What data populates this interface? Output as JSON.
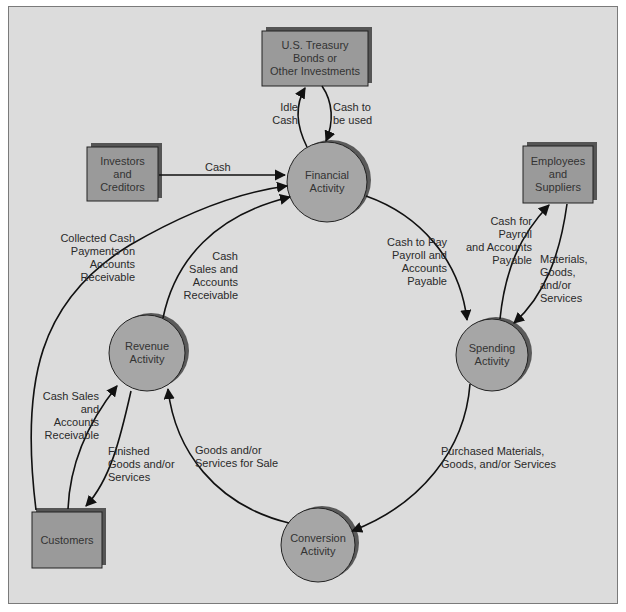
{
  "diagram": {
    "nodes": {
      "treasury": {
        "type": "box",
        "label": "U.S. Treasury\nBonds or\nOther Investments"
      },
      "investors": {
        "type": "box",
        "label": "Investors\nand\nCreditors"
      },
      "employees": {
        "type": "box",
        "label": "Employees\nand\nSuppliers"
      },
      "customers": {
        "type": "box",
        "label": "Customers"
      },
      "financial": {
        "type": "circle",
        "label": "Financial\nActivity"
      },
      "revenue": {
        "type": "circle",
        "label": "Revenue\nActivity"
      },
      "spending": {
        "type": "circle",
        "label": "Spending\nActivity"
      },
      "conversion": {
        "type": "circle",
        "label": "Conversion\nActivity"
      }
    },
    "edges": {
      "idle_cash": {
        "from": "financial",
        "to": "treasury",
        "label": "Idle\nCash"
      },
      "cash_to_be_used": {
        "from": "treasury",
        "to": "financial",
        "label": "Cash to\nbe used"
      },
      "investor_cash": {
        "from": "investors",
        "to": "financial",
        "label": "Cash"
      },
      "collected_cash": {
        "from": "customers",
        "to": "financial",
        "label": "Collected Cash\nPayments on\nAccounts\nReceivable"
      },
      "cash_sales_fin": {
        "from": "revenue",
        "to": "financial",
        "label": "Cash\nSales and\nAccounts\nReceivable"
      },
      "cash_to_pay": {
        "from": "financial",
        "to": "spending",
        "label": "Cash to Pay\nPayroll and\nAccounts\nPayable"
      },
      "cash_for_payroll": {
        "from": "spending",
        "to": "employees",
        "label": "Cash for\nPayroll\nand Accounts\nPayable"
      },
      "materials": {
        "from": "employees",
        "to": "spending",
        "label": "Materials,\nGoods,\nand/or\nServices"
      },
      "purchased": {
        "from": "spending",
        "to": "conversion",
        "label": "Purchased Materials,\nGoods, and/or Services"
      },
      "goods_for_sale": {
        "from": "conversion",
        "to": "revenue",
        "label": "Goods and/or\nServices for Sale"
      },
      "cash_sales_rev": {
        "from": "customers",
        "to": "revenue",
        "label": "Cash Sales\nand\nAccounts\nReceivable"
      },
      "finished_goods": {
        "from": "revenue",
        "to": "customers",
        "label": "Finished\nGoods and/or\nServices"
      }
    },
    "colors": {
      "background": "#dcdcdc",
      "box_fill": "#9a9a9a",
      "box_shadow": "#555555",
      "circle_fill": "#a6a6a6",
      "circle_shadow": "#5a5a5a",
      "stroke": "#111111"
    }
  }
}
